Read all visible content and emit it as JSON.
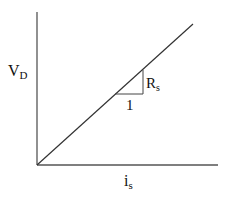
{
  "diagram": {
    "type": "linear-characteristic-plot",
    "y_axis": {
      "label_main": "V",
      "label_sub": "D"
    },
    "x_axis": {
      "label_main": "i",
      "label_sub": "s"
    },
    "line": {
      "description": "straight line through origin",
      "from": [
        37,
        165
      ],
      "to": [
        193,
        24
      ]
    },
    "slope_triangle": {
      "run_label": "1",
      "rise_label_main": "R",
      "rise_label_sub": "s"
    },
    "colors": {
      "line": "#333333",
      "axis": "#555555",
      "background": "#ffffff"
    }
  }
}
